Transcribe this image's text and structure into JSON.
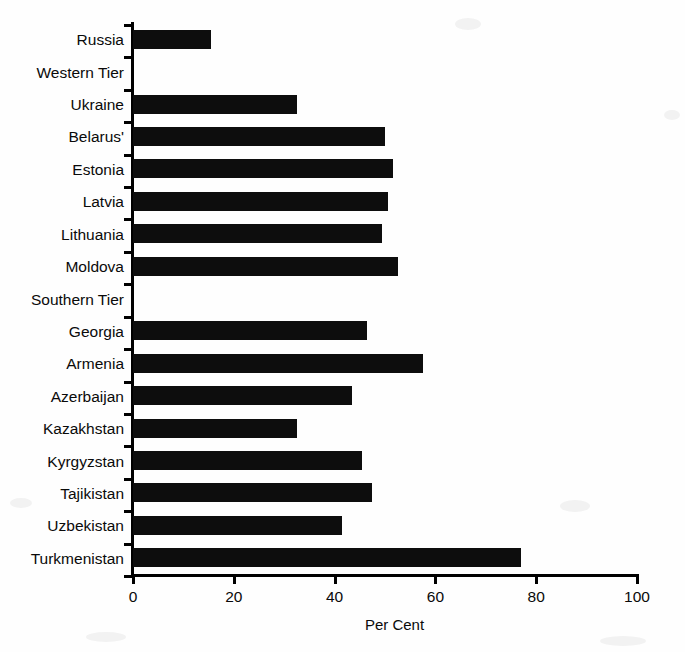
{
  "chart_data": {
    "type": "bar",
    "orientation": "horizontal",
    "title": "",
    "xlabel": "Per Cent",
    "ylabel": "",
    "xlim": [
      0,
      100
    ],
    "xticks": [
      0,
      20,
      40,
      60,
      80,
      100
    ],
    "xtick_labels": [
      "0",
      "20",
      "40",
      "60",
      "80",
      "100"
    ],
    "grid": false,
    "legend": null,
    "bar_color": "#0d0d0d",
    "background_color": "#fefefe",
    "categories": [
      "Russia",
      "Western Tier",
      "Ukraine",
      "Belarus'",
      "Estonia",
      "Latvia",
      "Lithuania",
      "Moldova",
      "Southern Tier",
      "Georgia",
      "Armenia",
      "Azerbaijan",
      "Kazakhstan",
      "Kyrgyzstan",
      "Tajikistan",
      "Uzbekistan",
      "Turkmenistan"
    ],
    "values": [
      15.5,
      0,
      32.5,
      50,
      51.5,
      50.5,
      49.5,
      52.5,
      0,
      46.5,
      57.5,
      43.5,
      32.5,
      45.5,
      47.5,
      41.5,
      77
    ],
    "notes": [
      "Western Tier and Southern Tier are group heading rows with no bar drawn."
    ]
  }
}
